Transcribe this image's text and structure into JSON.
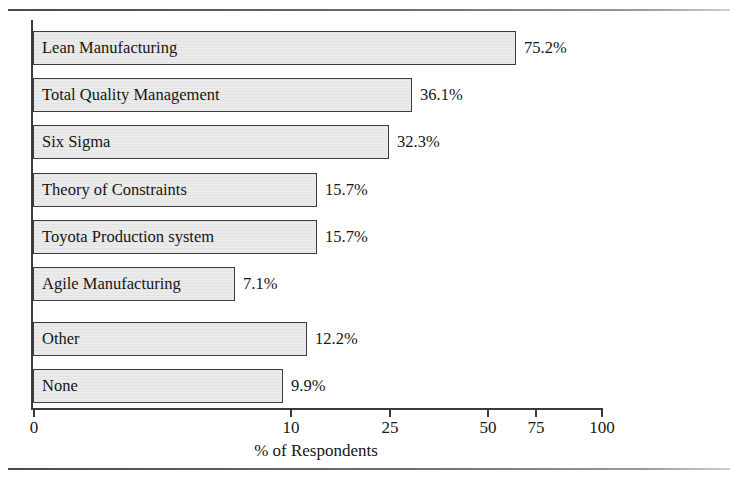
{
  "chart_data": {
    "type": "bar",
    "orientation": "horizontal",
    "title": "",
    "xlabel": "% of Respondents",
    "ylabel": "",
    "categories": [
      "Lean Manufacturing",
      "Total Quality Management",
      "Six Sigma",
      "Theory of Constraints",
      "Toyota Production system",
      "Agile Manufacturing",
      "Other",
      "None"
    ],
    "values": [
      75.2,
      36.1,
      32.3,
      15.7,
      15.7,
      7.1,
      12.2,
      9.9
    ],
    "value_labels": [
      "75.2%",
      "36.1%",
      "32.3%",
      "15.7%",
      "15.7%",
      "7.1%",
      "12.2%",
      "9.9%"
    ],
    "xticks": [
      0,
      10,
      25,
      50,
      75,
      100
    ],
    "xtick_labels": [
      "0",
      "10",
      "25",
      "50",
      "75",
      "100"
    ],
    "xlim": [
      0,
      100
    ],
    "axis_scale": "non-linear",
    "grid": false,
    "legend": false,
    "bar_fill_color": "#ebebeb",
    "bar_edge_color": "#3c3c3c",
    "text_color": "#161616"
  },
  "bars": [
    {
      "label": "Lean Manufacturing",
      "value_label": "75.2%",
      "left": 33,
      "width": 483,
      "top": 31
    },
    {
      "label": "Total Quality Management",
      "value_label": "36.1%",
      "left": 33,
      "width": 379,
      "top": 78
    },
    {
      "label": "Six Sigma",
      "value_label": "32.3%",
      "left": 33,
      "width": 356,
      "top": 125
    },
    {
      "label": "Theory of Constraints",
      "value_label": "15.7%",
      "left": 33,
      "width": 284,
      "top": 173
    },
    {
      "label": "Toyota Production system",
      "value_label": "15.7%",
      "left": 33,
      "width": 284,
      "top": 220
    },
    {
      "label": "Agile Manufacturing",
      "value_label": "7.1%",
      "left": 33,
      "width": 202,
      "top": 267
    },
    {
      "label": "Other",
      "value_label": "12.2%",
      "left": 33,
      "width": 274,
      "top": 322
    },
    {
      "label": "None",
      "value_label": "9.9%",
      "left": 33,
      "width": 250,
      "top": 369
    }
  ],
  "ticks": [
    {
      "label": "0",
      "x": 33
    },
    {
      "label": "10",
      "x": 290
    },
    {
      "label": "25",
      "x": 389
    },
    {
      "label": "50",
      "x": 487
    },
    {
      "label": "75",
      "x": 535
    },
    {
      "label": "100",
      "x": 601
    }
  ]
}
